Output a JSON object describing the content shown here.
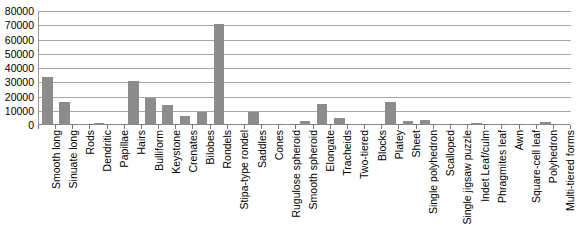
{
  "chart_data": {
    "type": "bar",
    "title": "",
    "subtitle": "",
    "xlabel": "",
    "ylabel": "",
    "ylim": [
      0,
      80000
    ],
    "ytick_labels": [
      "0",
      "10000",
      "20000",
      "30000",
      "40000",
      "50000",
      "60000",
      "70000",
      "80000"
    ],
    "yticks": [
      0,
      10000,
      20000,
      30000,
      40000,
      50000,
      60000,
      70000,
      80000
    ],
    "grid": true,
    "legend": false,
    "legend_position": "none",
    "bar_color": "#8c8c8c",
    "gridline_color": "#a6a6a6",
    "axis_color": "#7a7a7a",
    "categories": [
      "Smooth long",
      "Sinuate long",
      "Rods",
      "Dendritic",
      "Papillae",
      "Hairs",
      "Bulliform",
      "Keystone",
      "Crenates",
      "Bilobes",
      "Rondels",
      "Stipa-type rondel",
      "Saddles",
      "Cones",
      "Rugulose spheroid",
      "Smooth spheroid",
      "Elongate",
      "Tracheids",
      "Two-tiered",
      "Blocks",
      "Platey",
      "Sheet",
      "Single polyhedron",
      "Scalloped",
      "Single jigsaw puzzle",
      "Indet Leaf/culm",
      "Phragmites leaf",
      "Awn",
      "Square-cell leaf",
      "Polyhedron",
      "Multi-tiered forms"
    ],
    "values": [
      34000,
      16000,
      200,
      1500,
      400,
      31000,
      19000,
      14000,
      6000,
      9000,
      71000,
      600,
      9000,
      900,
      400,
      3000,
      15000,
      5000,
      300,
      200,
      16000,
      3000,
      3500,
      1000,
      100,
      1500,
      300,
      100,
      200,
      1800,
      400
    ]
  }
}
